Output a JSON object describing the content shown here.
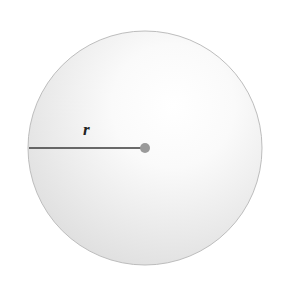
{
  "diagram": {
    "type": "circle-radius",
    "circle": {
      "cx": 145,
      "cy": 148,
      "r": 117,
      "fill_light": "#ffffff",
      "fill_dark": "#e4e4e4",
      "stroke": "#b8b8b8"
    },
    "radius_line": {
      "x1": 29,
      "y1": 148,
      "x2": 145,
      "y2": 148,
      "color": "#3a3a3a"
    },
    "center_point": {
      "cx": 145,
      "cy": 148,
      "r": 5,
      "color": "#9a9a9a"
    },
    "radius_label": "r"
  }
}
